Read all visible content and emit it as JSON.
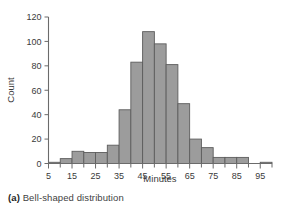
{
  "caption": {
    "tag": "(a)",
    "text": "Bell-shaped distribution"
  },
  "colors": {
    "bar_fill": "#9c9c9c",
    "bar_stroke": "#5d5d5d",
    "axis": "#6b6b6b",
    "text": "#3a3a3a",
    "background": "#ffffff"
  },
  "chart_data": {
    "type": "bar",
    "title": "",
    "subtitle": "",
    "xlabel": "Minutes",
    "ylabel": "Count",
    "xlim": [
      5,
      100
    ],
    "ylim": [
      0,
      120
    ],
    "grid": false,
    "legend": false,
    "bin_width": 5,
    "histogram": true,
    "xticks": [
      5,
      15,
      25,
      35,
      45,
      55,
      65,
      75,
      85,
      95
    ],
    "xtick_labels": [
      "5",
      "15",
      "25",
      "35",
      "45",
      "55",
      "65",
      "75",
      "85",
      "95"
    ],
    "xminorticks": [
      10,
      20,
      30,
      40,
      50,
      60,
      70,
      80,
      90,
      100
    ],
    "yticks": [
      0,
      20,
      40,
      60,
      80,
      100,
      120
    ],
    "ytick_labels": [
      "0",
      "20",
      "40",
      "60",
      "80",
      "100",
      "120"
    ],
    "bins": [
      {
        "start": 5,
        "end": 10,
        "label": "5-10",
        "value": 1
      },
      {
        "start": 10,
        "end": 15,
        "label": "10-15",
        "value": 4
      },
      {
        "start": 15,
        "end": 20,
        "label": "15-20",
        "value": 10
      },
      {
        "start": 20,
        "end": 25,
        "label": "20-25",
        "value": 9
      },
      {
        "start": 25,
        "end": 30,
        "label": "25-30",
        "value": 9
      },
      {
        "start": 30,
        "end": 35,
        "label": "30-35",
        "value": 15
      },
      {
        "start": 35,
        "end": 40,
        "label": "35-40",
        "value": 44
      },
      {
        "start": 40,
        "end": 45,
        "label": "40-45",
        "value": 83
      },
      {
        "start": 45,
        "end": 50,
        "label": "45-50",
        "value": 108
      },
      {
        "start": 50,
        "end": 55,
        "label": "50-55",
        "value": 98
      },
      {
        "start": 55,
        "end": 60,
        "label": "55-60",
        "value": 81
      },
      {
        "start": 60,
        "end": 65,
        "label": "60-65",
        "value": 49
      },
      {
        "start": 65,
        "end": 70,
        "label": "65-70",
        "value": 20
      },
      {
        "start": 70,
        "end": 75,
        "label": "70-75",
        "value": 13
      },
      {
        "start": 75,
        "end": 80,
        "label": "75-80",
        "value": 5
      },
      {
        "start": 80,
        "end": 85,
        "label": "80-85",
        "value": 5
      },
      {
        "start": 85,
        "end": 90,
        "label": "85-90",
        "value": 5
      },
      {
        "start": 90,
        "end": 95,
        "label": "90-95",
        "value": 0
      },
      {
        "start": 95,
        "end": 100,
        "label": "95-100",
        "value": 1
      }
    ],
    "categories": [
      "5-10",
      "10-15",
      "15-20",
      "20-25",
      "25-30",
      "30-35",
      "35-40",
      "40-45",
      "45-50",
      "50-55",
      "55-60",
      "60-65",
      "65-70",
      "70-75",
      "75-80",
      "80-85",
      "85-90",
      "90-95",
      "95-100"
    ],
    "values": [
      1,
      4,
      10,
      9,
      9,
      15,
      44,
      83,
      108,
      98,
      81,
      49,
      20,
      13,
      5,
      5,
      5,
      0,
      1
    ]
  }
}
